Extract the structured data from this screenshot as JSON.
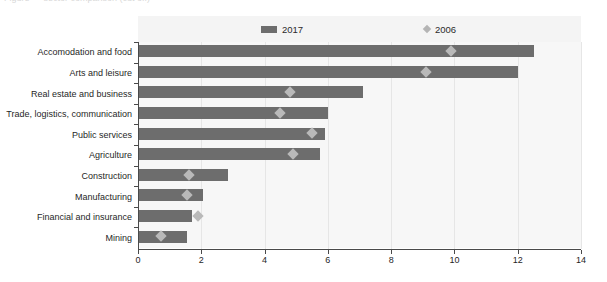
{
  "figure": {
    "top_caption_sliver": "Figure — sector comparison (cut off)"
  },
  "legend": {
    "position": "top-inside",
    "entries": [
      {
        "label": "2017",
        "marker": "bar-swatch",
        "color": "#6d6d6d"
      },
      {
        "label": "2006",
        "marker": "diamond-swatch",
        "color": "#b9b9b9"
      }
    ]
  },
  "axis": {
    "x_ticks": [
      "0",
      "2",
      "4",
      "6",
      "8",
      "10",
      "12",
      "14"
    ]
  },
  "chart_data": {
    "type": "bar",
    "orientation": "horizontal",
    "title": "",
    "subtitle": "",
    "xlabel": "",
    "ylabel": "",
    "xlim": [
      0,
      14
    ],
    "xticks": [
      0,
      2,
      4,
      6,
      8,
      10,
      12,
      14
    ],
    "grid": true,
    "grid_axis": "x",
    "legend_position": "top",
    "categories": [
      "Accomodation and food",
      "Arts and leisure",
      "Real estate and business",
      "Trade, logistics, communication",
      "Public services",
      "Agriculture",
      "Construction",
      "Manufacturing",
      "Financial and insurance",
      "Mining"
    ],
    "series": [
      {
        "name": "2017",
        "type": "bar",
        "color": "#6d6d6d",
        "values": [
          12.5,
          12.0,
          7.1,
          6.0,
          5.9,
          5.75,
          2.85,
          2.05,
          1.7,
          1.55
        ]
      },
      {
        "name": "2006",
        "type": "marker",
        "marker": "diamond",
        "color": "#b9b9b9",
        "values": [
          9.9,
          9.1,
          4.8,
          4.5,
          5.5,
          4.9,
          1.6,
          1.55,
          1.9,
          0.73
        ]
      }
    ]
  }
}
